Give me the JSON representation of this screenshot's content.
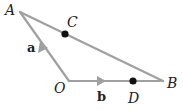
{
  "diagram": {
    "type": "vector-triangle",
    "points": {
      "A": {
        "label": "A",
        "x": 20,
        "y": 12
      },
      "O": {
        "label": "O",
        "x": 69,
        "y": 81
      },
      "B": {
        "label": "B",
        "x": 163,
        "y": 81
      },
      "C": {
        "label": "C",
        "x": 65,
        "y": 33
      },
      "D": {
        "label": "D",
        "x": 133,
        "y": 81
      }
    },
    "vectors": [
      {
        "name": "a",
        "label": "a",
        "from": "O",
        "to": "A"
      },
      {
        "name": "b",
        "label": "b",
        "from": "O",
        "to": "B"
      }
    ],
    "colors": {
      "line": "#a0a0a0",
      "point": "#111111",
      "text": "#222222"
    }
  }
}
